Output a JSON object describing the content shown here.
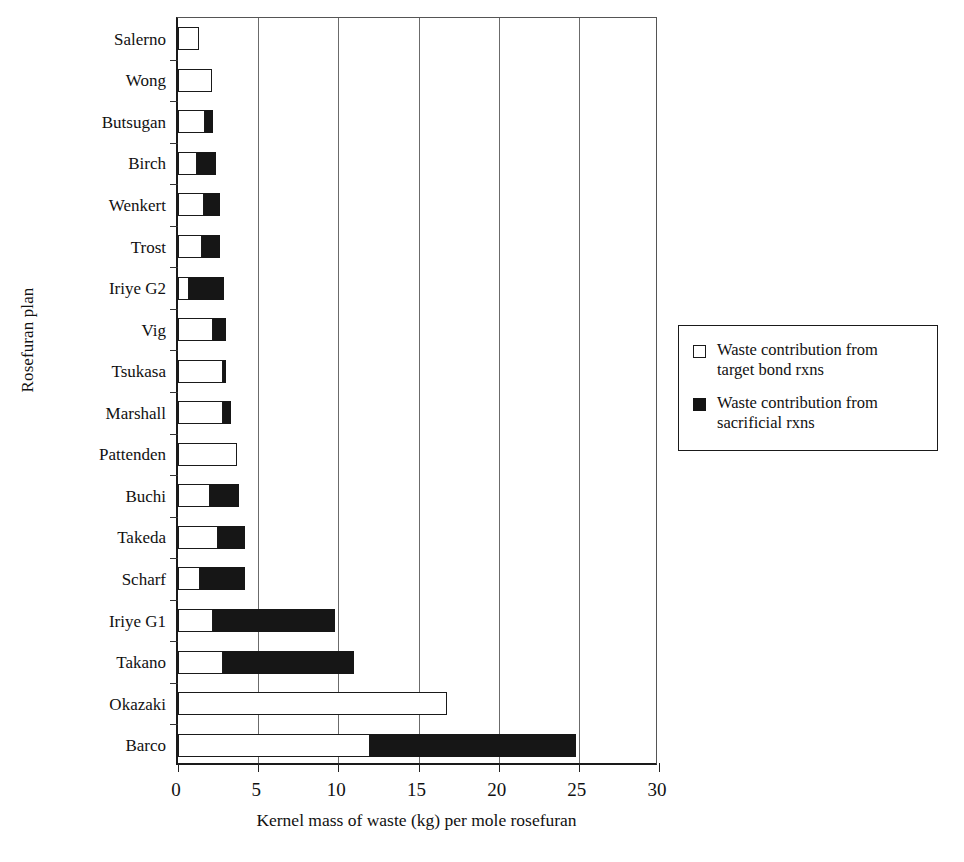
{
  "chart_data": {
    "type": "bar",
    "orientation": "horizontal",
    "stacked": true,
    "title": "",
    "xlabel": "Kernel mass of waste (kg) per mole rosefuran",
    "ylabel": "Rosefuran plan",
    "xlim": [
      0,
      30
    ],
    "xticks": [
      0,
      5,
      10,
      15,
      20,
      25,
      30
    ],
    "xtick_labels": [
      "0",
      "5",
      "10",
      "15",
      "20",
      "25",
      "30"
    ],
    "grid": "vertical",
    "legend_position": "right",
    "categories": [
      "Salerno",
      "Wong",
      "Butsugan",
      "Birch",
      "Wenkert",
      "Trost",
      "Iriye G2",
      "Vig",
      "Tsukasa",
      "Marshall",
      "Pattenden",
      "Buchi",
      "Takeda",
      "Scharf",
      "Iriye G1",
      "Takano",
      "Okazaki",
      "Barco"
    ],
    "series": [
      {
        "name": "Waste contribution from target bond rxns",
        "color": "#ffffff",
        "values": [
          1.3,
          2.1,
          1.7,
          1.2,
          1.6,
          1.5,
          0.7,
          2.2,
          2.8,
          2.8,
          3.7,
          2.0,
          2.5,
          1.4,
          2.2,
          2.8,
          16.8,
          12.0
        ]
      },
      {
        "name": "Waste contribution from sacrificial rxns",
        "color": "#161616",
        "values": [
          0.0,
          0.0,
          0.5,
          1.2,
          1.0,
          1.1,
          2.2,
          0.8,
          0.2,
          0.5,
          0.0,
          1.8,
          1.7,
          2.8,
          7.6,
          8.2,
          0.0,
          12.8
        ]
      }
    ],
    "totals": [
      1.3,
      2.1,
      2.2,
      2.4,
      2.6,
      2.6,
      2.9,
      3.0,
      3.0,
      3.3,
      3.7,
      3.8,
      4.2,
      4.2,
      9.8,
      11.0,
      16.8,
      24.8
    ]
  },
  "legend": {
    "entries": [
      {
        "swatch": "open",
        "line1": "Waste contribution from",
        "line2": "target bond rxns",
        "full": "Waste contribution from target bond rxns"
      },
      {
        "swatch": "solid",
        "line1": "Waste contribution from",
        "line2": "sacrificial rxns",
        "full": "Waste contribution from sacrificial rxns"
      }
    ]
  }
}
